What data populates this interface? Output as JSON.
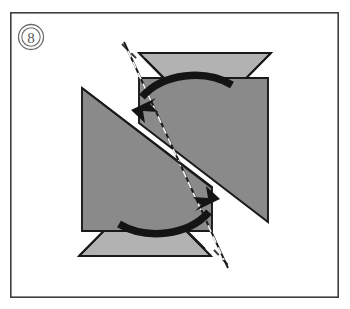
{
  "figure": {
    "step_number": "8",
    "step_badge_name": "step-number-8",
    "caption": "",
    "type": "origami-fold-diagram",
    "frame": {
      "x": 10,
      "y": 12,
      "width": 329,
      "height": 286,
      "stroke_color": "#3f3f3f"
    },
    "colors": {
      "background": "#ffffff",
      "paper_light": "#b2b2b2",
      "paper_dark": "#8a8a8a",
      "outline": "#1a1a1a",
      "badge_stroke": "#6d6d6d",
      "fold_line_light": "#f2f2f2",
      "fold_line_dark": "#3a3a3a",
      "arrow": "#141414"
    },
    "facets": [
      {
        "name": "top-triangle",
        "shade": "light",
        "points": "139,53 271,53 205,119"
      },
      {
        "name": "bottom-triangle",
        "shade": "light",
        "points": "79,256 211,256 145,190"
      },
      {
        "name": "left-flap",
        "shade": "dark",
        "points": "82,89 212,188 212,231 82,231"
      },
      {
        "name": "right-flap",
        "shade": "dark",
        "points": "268,78 268,221 138,122 138,78"
      }
    ],
    "fold_lines": [
      {
        "name": "main-diagonal-fold",
        "from": [
          124,
          41
        ],
        "to": [
          226,
          272
        ]
      },
      {
        "name": "top-facet-fold",
        "from": [
          139,
          53
        ],
        "to": [
          205,
          119
        ]
      },
      {
        "name": "bottom-facet-fold",
        "from": [
          145,
          190
        ],
        "to": [
          211,
          256
        ]
      }
    ],
    "arrows": [
      {
        "name": "upper-rotation-arrow",
        "direction": "counterclockwise-down-left",
        "tip": [
          132,
          108
        ]
      },
      {
        "name": "lower-rotation-arrow",
        "direction": "counterclockwise-up-right",
        "tip": [
          218,
          201
        ]
      }
    ]
  }
}
